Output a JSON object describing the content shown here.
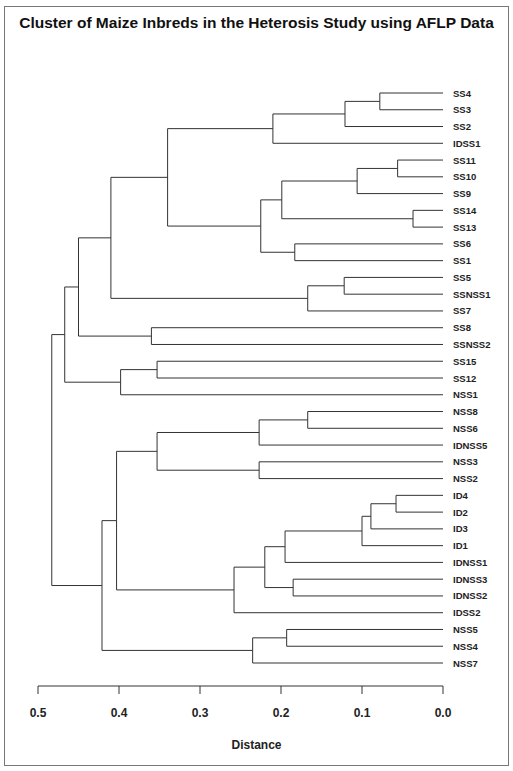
{
  "chart_data": {
    "type": "dendrogram",
    "title": "Cluster of Maize Inbreds in the Heterosis Study using AFLP Data",
    "xlabel": "Distance",
    "ylabel": "",
    "xlim": [
      0.5,
      0.0
    ],
    "x_ticks": [
      "0.5",
      "0.4",
      "0.3",
      "0.2",
      "0.1",
      "0.0"
    ],
    "grid": false,
    "leaves": [
      "SS4",
      "SS3",
      "SS2",
      "IDSS1",
      "SS11",
      "SS10",
      "SS9",
      "SS14",
      "SS13",
      "SS6",
      "SS1",
      "SS5",
      "SSNSS1",
      "SS7",
      "SS8",
      "SSNSS2",
      "SS15",
      "SS12",
      "NSS1",
      "NSS8",
      "NSS6",
      "IDNSS5",
      "NSS3",
      "NSS2",
      "ID4",
      "ID2",
      "ID3",
      "ID1",
      "IDNSS1",
      "IDNSS3",
      "IDNSS2",
      "IDSS2",
      "NSS5",
      "NSS4",
      "NSS7"
    ],
    "merges": [
      {
        "id": "n1",
        "children": [
          "SS4",
          "SS3"
        ],
        "distance": 0.078
      },
      {
        "id": "n2",
        "children": [
          "n1",
          "SS2"
        ],
        "distance": 0.121
      },
      {
        "id": "n3",
        "children": [
          "n2",
          "IDSS1"
        ],
        "distance": 0.21
      },
      {
        "id": "n4",
        "children": [
          "SS11",
          "SS10"
        ],
        "distance": 0.056
      },
      {
        "id": "n5",
        "children": [
          "n4",
          "SS9"
        ],
        "distance": 0.106
      },
      {
        "id": "n6",
        "children": [
          "SS14",
          "SS13"
        ],
        "distance": 0.037
      },
      {
        "id": "n7",
        "children": [
          "n5",
          "n6"
        ],
        "distance": 0.199
      },
      {
        "id": "n8",
        "children": [
          "SS6",
          "SS1"
        ],
        "distance": 0.183
      },
      {
        "id": "n9",
        "children": [
          "n7",
          "n8"
        ],
        "distance": 0.225
      },
      {
        "id": "n10",
        "children": [
          "n3",
          "n9"
        ],
        "distance": 0.34
      },
      {
        "id": "n11",
        "children": [
          "SS5",
          "SSNSS1"
        ],
        "distance": 0.122
      },
      {
        "id": "n12",
        "children": [
          "n11",
          "SS7"
        ],
        "distance": 0.167
      },
      {
        "id": "n13",
        "children": [
          "n10",
          "n12"
        ],
        "distance": 0.41
      },
      {
        "id": "n14",
        "children": [
          "SS8",
          "SSNSS2"
        ],
        "distance": 0.36
      },
      {
        "id": "n15",
        "children": [
          "n13",
          "n14"
        ],
        "distance": 0.45
      },
      {
        "id": "n16",
        "children": [
          "SS15",
          "SS12"
        ],
        "distance": 0.353
      },
      {
        "id": "n17",
        "children": [
          "n16",
          "NSS1"
        ],
        "distance": 0.398
      },
      {
        "id": "n18",
        "children": [
          "n15",
          "n17"
        ],
        "distance": 0.467
      },
      {
        "id": "n19",
        "children": [
          "NSS8",
          "NSS6"
        ],
        "distance": 0.167
      },
      {
        "id": "n20",
        "children": [
          "n19",
          "IDNSS5"
        ],
        "distance": 0.227
      },
      {
        "id": "n21",
        "children": [
          "NSS3",
          "NSS2"
        ],
        "distance": 0.227
      },
      {
        "id": "n22",
        "children": [
          "n20",
          "n21"
        ],
        "distance": 0.353
      },
      {
        "id": "n23",
        "children": [
          "ID4",
          "ID2"
        ],
        "distance": 0.058
      },
      {
        "id": "n24",
        "children": [
          "n23",
          "ID3"
        ],
        "distance": 0.089
      },
      {
        "id": "n25",
        "children": [
          "n24",
          "ID1"
        ],
        "distance": 0.1
      },
      {
        "id": "n26",
        "children": [
          "n25",
          "IDNSS1"
        ],
        "distance": 0.195
      },
      {
        "id": "n27",
        "children": [
          "IDNSS3",
          "IDNSS2"
        ],
        "distance": 0.185
      },
      {
        "id": "n28",
        "children": [
          "n26",
          "n27"
        ],
        "distance": 0.22
      },
      {
        "id": "n29",
        "children": [
          "n28",
          "IDSS2"
        ],
        "distance": 0.258
      },
      {
        "id": "n30",
        "children": [
          "n22",
          "n29"
        ],
        "distance": 0.403
      },
      {
        "id": "n31",
        "children": [
          "NSS5",
          "NSS4"
        ],
        "distance": 0.193
      },
      {
        "id": "n32",
        "children": [
          "n31",
          "NSS7"
        ],
        "distance": 0.235
      },
      {
        "id": "n33",
        "children": [
          "n30",
          "n32"
        ],
        "distance": 0.421
      },
      {
        "id": "root",
        "children": [
          "n18",
          "n33"
        ],
        "distance": 0.483
      }
    ],
    "line_color": "#333333"
  }
}
